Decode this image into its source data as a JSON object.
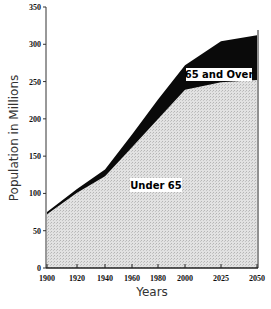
{
  "chart_data": {
    "type": "area",
    "stacked": true,
    "title": "",
    "xlabel": "Years",
    "ylabel": "Population in Millions",
    "x": [
      1900,
      1920,
      1940,
      1960,
      1980,
      2000,
      2025,
      2050
    ],
    "x_tick_labels": [
      "1900",
      "1920",
      "1940",
      "1960",
      "1980",
      "2000",
      "2025",
      "2050"
    ],
    "y_ticks": [
      0,
      50,
      100,
      150,
      200,
      250,
      300,
      350
    ],
    "y_tick_labels": [
      "0",
      "50",
      "100",
      "150",
      "200",
      "250",
      "300",
      "350"
    ],
    "ylim": [
      0,
      350
    ],
    "grid": false,
    "legend": "none (inline labels)",
    "series": [
      {
        "name": "Under 65",
        "label": "Under 65",
        "color": "#d8d8d8",
        "values": [
          72,
          101,
          123,
          162,
          200,
          239,
          249,
          252
        ]
      },
      {
        "name": "65 and Over",
        "label": "65 and Over",
        "color": "#000000",
        "values": [
          3,
          5,
          9,
          17,
          26,
          33,
          55,
          60
        ]
      }
    ],
    "totals": [
      75,
      106,
      132,
      179,
      226,
      272,
      304,
      312
    ],
    "annotations": [
      {
        "text": "Under 65",
        "x": 1965,
        "y": 115
      },
      {
        "text": "65 and Over",
        "x": 2025,
        "y": 262
      }
    ]
  }
}
